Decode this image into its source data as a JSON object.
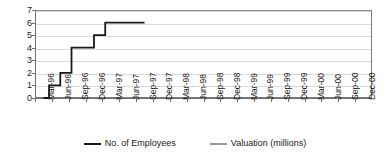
{
  "chart_data": {
    "type": "line",
    "title": "",
    "xlabel": "",
    "ylabel": "",
    "ylim": [
      0,
      7
    ],
    "yticks": [
      0,
      1,
      2,
      3,
      4,
      5,
      6,
      7
    ],
    "grid": true,
    "legend_position": "bottom",
    "categories": [
      "Mar-96",
      "Jun-96",
      "Sep-96",
      "Dec-96",
      "Mar-97",
      "Jun-97",
      "Sep-97",
      "Dec-97",
      "Mar-98",
      "Jun-98",
      "Sep-98",
      "Dec-98",
      "Mar-99",
      "Jun-99",
      "Sep-99",
      "Dec-99",
      "Mar-00",
      "Jun-00",
      "Sep-00",
      "Dec-00"
    ],
    "series": [
      {
        "name": "No. of Employees",
        "color": "#1a1a1a",
        "step": true,
        "x": [
          "Mar-96",
          "Apr-96",
          "May-96",
          "Jun-96",
          "Jul-96",
          "Aug-96",
          "Sep-96",
          "Oct-96",
          "Nov-96",
          "Dec-96",
          "Jan-97",
          "Feb-97",
          "Mar-97",
          "Apr-97",
          "May-97",
          "Jun-97",
          "Jul-97",
          "Aug-97",
          "Sep-97"
        ],
        "values": [
          0,
          1,
          1,
          2,
          2,
          4,
          4,
          4,
          4,
          5,
          5,
          6,
          6,
          6,
          6,
          6,
          6,
          6,
          6
        ]
      },
      {
        "name": "Valuation (millions)",
        "color": "#9a9a9a",
        "step": false,
        "x": [],
        "values": []
      }
    ]
  },
  "legend": {
    "items": [
      {
        "label": "No. of Employees",
        "color": "#1a1a1a"
      },
      {
        "label": "Valuation (millions)",
        "color": "#9a9a9a"
      }
    ]
  }
}
